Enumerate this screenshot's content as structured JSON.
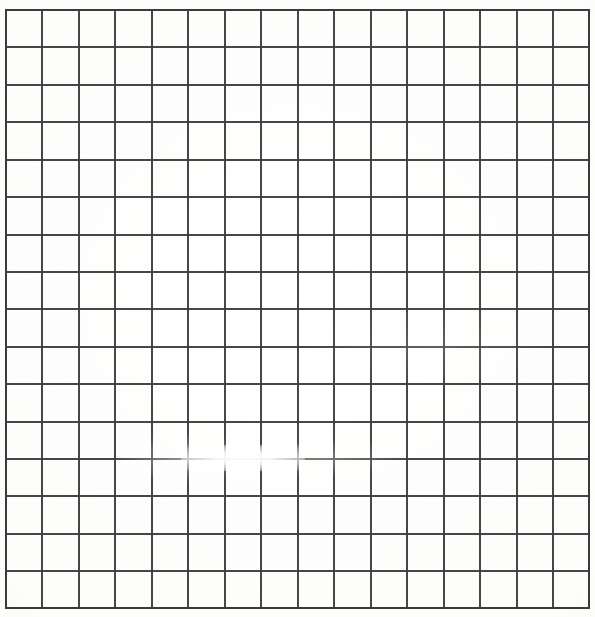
{
  "document": {
    "kind": "scanned-grid-paper",
    "title": "Blank square grid",
    "caption": "A blank 16 by 16 square grid drawn in dark grey ruling on white paper, with a light scan glare near the left-of-centre of the thirteenth horizontal rule.",
    "background_color": "#fefefe",
    "paper_color": "#ffffff",
    "line_color": "#3b3b3b",
    "line_width_px": 2,
    "width_px": 595,
    "height_px": 617
  },
  "grid": {
    "columns": 16,
    "rows": 16,
    "vertical_line_count": 17,
    "horizontal_line_count": 17,
    "cell_width_px": 36.4,
    "cell_height_px": 37.4,
    "origin_x_px": 5,
    "origin_y_px": 9,
    "right_edge_x_px": 588,
    "bottom_edge_y_px": 607,
    "vertical_lines_x": [
      5,
      41,
      78,
      114,
      151,
      187,
      224,
      260,
      297,
      333,
      370,
      406,
      443,
      479,
      516,
      552,
      588
    ],
    "horizontal_lines_y": [
      9,
      46,
      84,
      121,
      159,
      196,
      234,
      271,
      308,
      346,
      383,
      421,
      458,
      495,
      533,
      570,
      607
    ]
  },
  "artifacts": [
    {
      "name": "scan-glare",
      "label": "Light glare washing out part of the thirteenth horizontal rule",
      "center_x_px": 243,
      "center_y_px": 458,
      "radius_x_px": 62,
      "radius_y_px": 13
    }
  ]
}
